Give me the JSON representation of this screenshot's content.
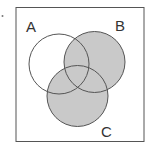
{
  "diagram": {
    "type": "venn",
    "shaded_region": "B ∪ C",
    "colors": {
      "background": "#ffffff",
      "shade": "#c9c9c9",
      "stroke": "#555555",
      "frame": "#555555"
    },
    "sets": [
      {
        "label": "A",
        "shaded": false
      },
      {
        "label": "B",
        "shaded": true
      },
      {
        "label": "C",
        "shaded": true
      }
    ],
    "labels": {
      "a": "A",
      "b": "B",
      "c": "C"
    },
    "bullet": "·"
  }
}
